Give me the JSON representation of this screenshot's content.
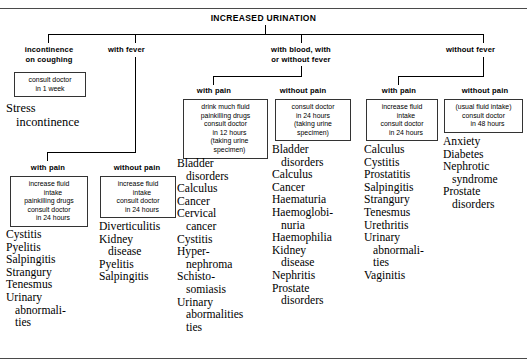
{
  "chart": {
    "root_title": "INCREASED URINATION",
    "type": "decision-tree"
  },
  "branches": {
    "incontinence": {
      "label_line1": "incontinence",
      "label_line2": "on coughing",
      "advice": [
        "consult doctor",
        "in 1 week"
      ],
      "diagnoses": [
        "Stress",
        "incontinence"
      ]
    },
    "with_fever": {
      "label": "with fever",
      "sub": {
        "with_pain": {
          "label": "with pain",
          "advice": [
            "increase fluid",
            "intake",
            "painkilling drugs",
            "consult doctor",
            "in 24 hours"
          ],
          "advice_indent": [
            false,
            true,
            false,
            false,
            true
          ],
          "diagnoses": [
            "Cystitis",
            "Pyelitis",
            "Salpingitis",
            "Strangury",
            "Tenesmus",
            "Urinary",
            "abnormali-",
            "ties"
          ],
          "diagnoses_indent": [
            false,
            false,
            false,
            false,
            false,
            false,
            true,
            true
          ]
        },
        "without_pain": {
          "label": "without pain",
          "advice": [
            "increase fluid",
            "intake",
            "consult doctor",
            "in 24 hours"
          ],
          "advice_indent": [
            false,
            true,
            false,
            true
          ],
          "diagnoses": [
            "Diverticulitis",
            "Kidney",
            "disease",
            "Pyelitis",
            "Salpingitis"
          ],
          "diagnoses_indent": [
            false,
            false,
            true,
            false,
            false
          ]
        }
      }
    },
    "with_blood": {
      "label_line1": "with blood, with",
      "label_line2": "or without fever",
      "sub": {
        "with_pain": {
          "label": "with pain",
          "advice": [
            "drink much fluid",
            "painkilling drugs",
            "consult doctor",
            "in 12 hours",
            "(taking urine",
            "specimen)"
          ],
          "advice_indent": [
            false,
            false,
            false,
            true,
            true,
            true
          ],
          "diagnoses": [
            "Bladder",
            "disorders",
            "Calculus",
            "Cancer",
            "Cervical",
            "cancer",
            "Cystitis",
            "Hyper-",
            "nephroma",
            "Schisto-",
            "somiasis",
            "Urinary",
            "abormalities",
            "ties"
          ],
          "diagnoses_indent": [
            false,
            true,
            false,
            false,
            false,
            true,
            false,
            false,
            true,
            false,
            true,
            false,
            true,
            true
          ]
        },
        "without_pain": {
          "label": "without pain",
          "advice": [
            "consult doctor",
            "in 24 hours",
            "(taking urine",
            "specimen)"
          ],
          "advice_indent": [
            false,
            false,
            false,
            false
          ],
          "diagnoses": [
            "Bladder",
            "disorders",
            "Calculus",
            "Cancer",
            "Haematuria",
            "Haemoglobi-",
            "nuria",
            "Haemophilia",
            "Kidney",
            "disease",
            "Nephritis",
            "Prostate",
            "disorders"
          ],
          "diagnoses_indent": [
            false,
            true,
            false,
            false,
            false,
            false,
            true,
            false,
            false,
            true,
            false,
            false,
            true
          ]
        }
      }
    },
    "without_fever": {
      "label": "without fever",
      "sub": {
        "with_pain": {
          "label": "with pain",
          "advice": [
            "increase fluid",
            "intake",
            "consult doctor",
            "in 24 hours"
          ],
          "advice_indent": [
            false,
            true,
            false,
            true
          ],
          "diagnoses": [
            "Calculus",
            "Cystitis",
            "Prostatitis",
            "Salpingitis",
            "Strangury",
            "Tenesmus",
            "Urethritis",
            "Urinary",
            "abnormali-",
            "ties",
            "Vaginitis"
          ],
          "diagnoses_indent": [
            false,
            false,
            false,
            false,
            false,
            false,
            false,
            false,
            true,
            true,
            false
          ]
        },
        "without_pain": {
          "label": "without pain",
          "advice": [
            "(usual fluid intake)",
            "consult doctor",
            "in 48 hours"
          ],
          "advice_indent": [
            false,
            false,
            true
          ],
          "diagnoses": [
            "Anxiety",
            "Diabetes",
            "Nephrotic",
            "syndrome",
            "Prostate",
            "disorders"
          ],
          "diagnoses_indent": [
            false,
            false,
            false,
            true,
            false,
            true
          ]
        }
      }
    }
  }
}
